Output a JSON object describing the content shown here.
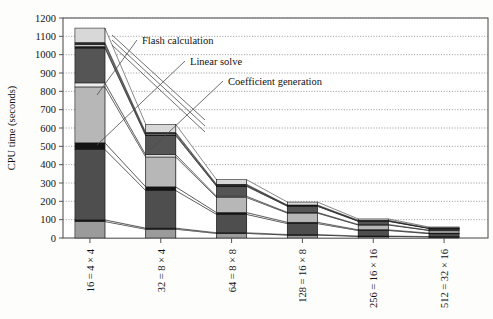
{
  "chart_data": {
    "type": "bar",
    "title": "",
    "xlabel": "",
    "ylabel": "CPU time (seconds)",
    "ylim": [
      0,
      1200
    ],
    "ytick_step": 100,
    "yticks": [
      "0",
      "100",
      "200",
      "300",
      "400",
      "500",
      "600",
      "700",
      "800",
      "900",
      "1000",
      "1100",
      "1200"
    ],
    "grid": true,
    "legend_position": "annotations-inline",
    "categories": [
      "16 = 4 × 4",
      "32 = 8 × 4",
      "64 = 8 × 8",
      "128 = 16 × 8",
      "256 = 16 × 16",
      "512 = 32 × 16"
    ],
    "totals": [
      1145,
      620,
      318,
      196,
      104,
      60
    ],
    "series": [
      {
        "name": "Other (base)",
        "color": "#9b9b9b",
        "values": [
          90,
          48,
          25,
          16,
          9,
          6
        ]
      },
      {
        "name": "Separator a",
        "color": "#1a1a1a",
        "values": [
          9,
          6,
          4,
          3,
          2,
          2
        ]
      },
      {
        "name": "Coefficient generation",
        "color": "#4e4e4e",
        "values": [
          384,
          205,
          100,
          60,
          30,
          16
        ]
      },
      {
        "name": "Separator b",
        "color": "#141414",
        "values": [
          36,
          20,
          10,
          7,
          4,
          3
        ]
      },
      {
        "name": "Linear solve",
        "color": "#b7b7b7",
        "values": [
          305,
          163,
          82,
          50,
          26,
          14
        ]
      },
      {
        "name": "Separator c",
        "color": "#ededed",
        "values": [
          22,
          12,
          7,
          4,
          3,
          2
        ]
      },
      {
        "name": "Flash calculation",
        "color": "#555555",
        "values": [
          190,
          104,
          54,
          33,
          17,
          9
        ]
      },
      {
        "name": "Separator d",
        "color": "#1c1c1c",
        "values": [
          8,
          5,
          3,
          2,
          2,
          1
        ]
      },
      {
        "name": "Band e",
        "color": "#c9c9c9",
        "values": [
          12,
          7,
          4,
          3,
          2,
          1
        ]
      },
      {
        "name": "Band f",
        "color": "#2a2a2a",
        "values": [
          10,
          6,
          4,
          2,
          2,
          1
        ]
      },
      {
        "name": "Top band",
        "color": "#d8d8d8",
        "values": [
          79,
          44,
          25,
          16,
          7,
          5
        ]
      }
    ],
    "annotations": [
      {
        "id": "flash-calculation",
        "text": "Flash calculation"
      },
      {
        "id": "linear-solve",
        "text": "Linear solve"
      },
      {
        "id": "coefficient-generation",
        "text": "Coefficient generation"
      }
    ]
  }
}
